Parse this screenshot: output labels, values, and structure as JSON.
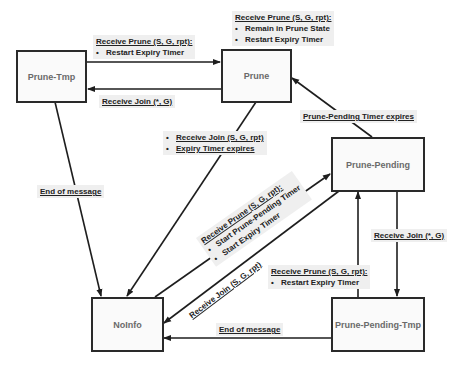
{
  "states": {
    "prune_tmp": "Prune-Tmp",
    "prune": "Prune",
    "prune_pending": "Prune-Pending",
    "noinfo": "NoInfo",
    "prune_pending_tmp": "Prune-Pending-Tmp"
  },
  "transitions": {
    "tmp_to_prune": {
      "title": "Receive Prune (S, G, rpt):",
      "actions": [
        "Restart Expiry Timer"
      ]
    },
    "prune_self": {
      "title": "Receive Prune (S, G, rpt):",
      "actions": [
        "Remain in Prune State",
        "Restart Expiry Timer"
      ]
    },
    "prune_to_tmp": {
      "title": "Receive Join (*, G)"
    },
    "prune_to_noinfo": {
      "events": [
        "Receive Join (S, G, rpt)",
        "Expiry Timer expires"
      ]
    },
    "pending_to_prune": {
      "title": "Prune-Pending Timer expires"
    },
    "tmp_to_noinfo": {
      "title": "End of message"
    },
    "noinfo_to_pending": {
      "title": "Receive Prune (S, G, rpt):",
      "actions": [
        "Start Prune-Pending Timer",
        "Start Expiry Timer"
      ]
    },
    "pending_to_noinfo": {
      "title": "Receive Join (S, G, rpt)"
    },
    "pending_to_pendingtmp": {
      "title": "Receive Join (*, G)"
    },
    "pendingtmp_to_pending": {
      "title": "Receive Prune (S, G, rpt):",
      "actions": [
        "Restart Expiry Timer"
      ]
    },
    "pendingtmp_to_noinfo": {
      "title": "End of message"
    }
  },
  "colors": {
    "line": "#1e1e1e",
    "label_bg": "#efefef",
    "state_text": "#6a6a6a"
  }
}
